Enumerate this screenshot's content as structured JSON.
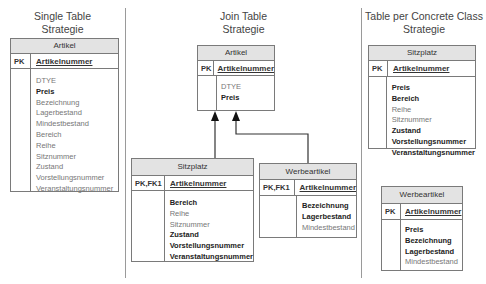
{
  "sections": [
    {
      "title_line1": "Single Table",
      "title_line2": "Strategie"
    },
    {
      "title_line1": "Join Table",
      "title_line2": "Strategie"
    },
    {
      "title_line1": "Table per Concrete Class",
      "title_line2": "Strategie"
    }
  ],
  "single_table": {
    "artikel": {
      "name": "Artikel",
      "pk_label": "PK",
      "pk_name": "Artikelnummer",
      "attributes": [
        {
          "name": "DTYE",
          "style": "plain"
        },
        {
          "name": "Preis",
          "style": "bold"
        },
        {
          "name": "Bezeichnung",
          "style": "plain"
        },
        {
          "name": "Lagerbestand",
          "style": "plain"
        },
        {
          "name": "Mindestbestand",
          "style": "plain"
        },
        {
          "name": "Bereich",
          "style": "plain"
        },
        {
          "name": "Reihe",
          "style": "plain"
        },
        {
          "name": "Sitznummer",
          "style": "plain"
        },
        {
          "name": "Zustand",
          "style": "plain"
        },
        {
          "name": "Vorstellungsnummer",
          "style": "plain"
        },
        {
          "name": "Veranstaltungsnummer",
          "style": "plain"
        }
      ]
    }
  },
  "join_table": {
    "artikel": {
      "name": "Artikel",
      "pk_label": "PK",
      "pk_name": "Artikelnummer",
      "attributes": [
        {
          "name": "DTYE",
          "style": "plain"
        },
        {
          "name": "Preis",
          "style": "bold"
        }
      ]
    },
    "sitzplatz": {
      "name": "Sitzplatz",
      "pk_label": "PK,FK1",
      "pk_name": "Artikelnummer",
      "attributes": [
        {
          "name": "Bereich",
          "style": "bold"
        },
        {
          "name": "Reihe",
          "style": "plain"
        },
        {
          "name": "Sitznummer",
          "style": "plain"
        },
        {
          "name": "Zustand",
          "style": "bold"
        },
        {
          "name": "Vorstellungsnummer",
          "style": "bold"
        },
        {
          "name": "Veranstaltungsnummer",
          "style": "bold"
        }
      ]
    },
    "werbeartikel": {
      "name": "Werbeartikel",
      "pk_label": "PK,FK1",
      "pk_name": "Artikelnummer",
      "attributes": [
        {
          "name": "Bezeichnung",
          "style": "bold"
        },
        {
          "name": "Lagerbestand",
          "style": "bold"
        },
        {
          "name": "Mindestbestand",
          "style": "plain"
        }
      ]
    }
  },
  "concrete_table": {
    "sitzplatz": {
      "name": "Sitzplatz",
      "pk_label": "PK",
      "pk_name": "Artikelnummer",
      "attributes": [
        {
          "name": "Preis",
          "style": "bold"
        },
        {
          "name": "Bereich",
          "style": "bold"
        },
        {
          "name": "Reihe",
          "style": "plain"
        },
        {
          "name": "Sitznummer",
          "style": "plain"
        },
        {
          "name": "Zustand",
          "style": "bold"
        },
        {
          "name": "Vorstellungsnummer",
          "style": "bold"
        },
        {
          "name": "Veranstaltungsnummer",
          "style": "bold"
        }
      ]
    },
    "werbeartikel": {
      "name": "Werbeartikel",
      "pk_label": "PK",
      "pk_name": "Artikelnummer",
      "attributes": [
        {
          "name": "Preis",
          "style": "bold"
        },
        {
          "name": "Bezeichnung",
          "style": "bold"
        },
        {
          "name": "Lagerbestand",
          "style": "bold"
        },
        {
          "name": "Mindestbestand",
          "style": "plain"
        }
      ]
    }
  },
  "relations": [
    {
      "from": "Sitzplatz",
      "to": "Artikel",
      "type": "inheritance"
    },
    {
      "from": "Werbeartikel",
      "to": "Artikel",
      "type": "inheritance"
    }
  ]
}
